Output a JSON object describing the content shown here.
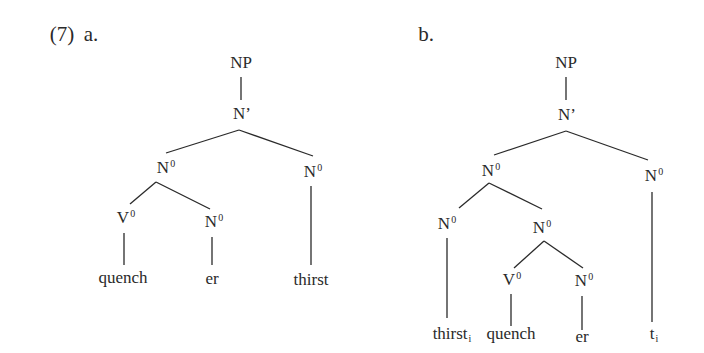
{
  "example": {
    "number": "(7)",
    "a_label": "a.",
    "b_label": "b."
  },
  "tree_a": {
    "root": "NP",
    "bar": "N’",
    "n0_compound": {
      "base": "N",
      "sup": "0"
    },
    "n0_right": {
      "base": "N",
      "sup": "0"
    },
    "v0": {
      "base": "V",
      "sup": "0"
    },
    "n0_suffix": {
      "base": "N",
      "sup": "0"
    },
    "words": {
      "quench": "quench",
      "er": "er",
      "thirst": "thirst"
    }
  },
  "tree_b": {
    "root": "NP",
    "bar": "N’",
    "n0_compound": {
      "base": "N",
      "sup": "0"
    },
    "n0_right": {
      "base": "N",
      "sup": "0"
    },
    "n0_incorporated": {
      "base": "N",
      "sup": "0"
    },
    "n0_inner": {
      "base": "N",
      "sup": "0"
    },
    "v0": {
      "base": "V",
      "sup": "0"
    },
    "n0_suffix": {
      "base": "N",
      "sup": "0"
    },
    "words": {
      "thirst": {
        "base": "thirst",
        "sub": "i"
      },
      "quench": "quench",
      "er": "er",
      "trace": {
        "base": "t",
        "sub": "i"
      }
    }
  }
}
